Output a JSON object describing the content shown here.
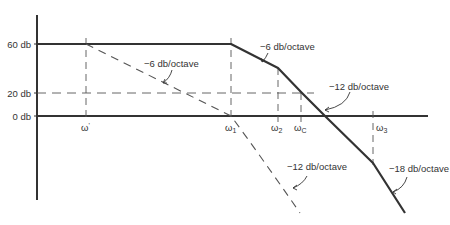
{
  "diagram": {
    "type": "bode-magnitude-asymptotic-plot",
    "y_axis_labels": [
      {
        "text": "60 db",
        "value": 60
      },
      {
        "text": "20 db",
        "value": 20
      },
      {
        "text": "0 db",
        "value": 0
      }
    ],
    "frequency_labels": [
      {
        "symbol": "ω",
        "sub": "'",
        "name": "omega-prime"
      },
      {
        "symbol": "ω",
        "sub": "1",
        "name": "omega-1"
      },
      {
        "symbol": "ω",
        "sub": "2",
        "name": "omega-2"
      },
      {
        "symbol": "ω",
        "sub": "C",
        "name": "omega-c"
      },
      {
        "symbol": "ω",
        "sub": "3",
        "name": "omega-3"
      }
    ],
    "annotations": {
      "solid_slope_1": "−6 db/octave",
      "solid_slope_2": "−12 db/octave",
      "solid_slope_3": "−18 db/octave",
      "dashed_slope_1": "−6 db/octave",
      "dashed_slope_2": "−12 db/octave"
    },
    "colors": {
      "line": "#333333",
      "dash": "#555555",
      "text": "#333333"
    }
  }
}
